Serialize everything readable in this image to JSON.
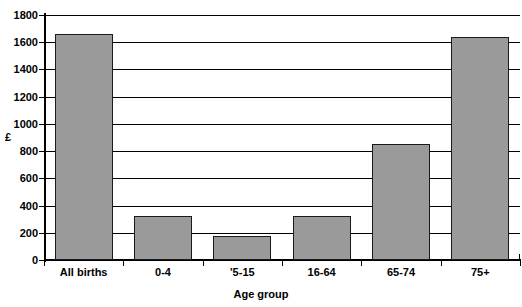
{
  "chart_data": {
    "type": "bar",
    "title": "",
    "xlabel": "Age group",
    "ylabel": "£",
    "categories": [
      "All births",
      "0-4",
      "'5-15",
      "16-64",
      "65-74",
      "75+"
    ],
    "values": [
      1660,
      320,
      180,
      320,
      850,
      1640
    ],
    "series": [
      {
        "name": "",
        "values": [
          1660,
          320,
          180,
          320,
          850,
          1640
        ]
      }
    ],
    "ylim": [
      0,
      1800
    ],
    "ytick_step": 200,
    "yticks": [
      0,
      200,
      400,
      600,
      800,
      1000,
      1200,
      1400,
      1600,
      1800
    ],
    "ytick_labels": [
      "0",
      "200",
      "400",
      "600",
      "800",
      "1000",
      "1200",
      "1400",
      "1600",
      "1800"
    ],
    "grid": true,
    "grid_axis": "y",
    "legend": false,
    "legend_position": "none",
    "bar_fill_color": "#9a9a9a",
    "bar_edge_color": "#1a1a1a",
    "axis_color": "#000000",
    "background_color": "#ffffff"
  }
}
